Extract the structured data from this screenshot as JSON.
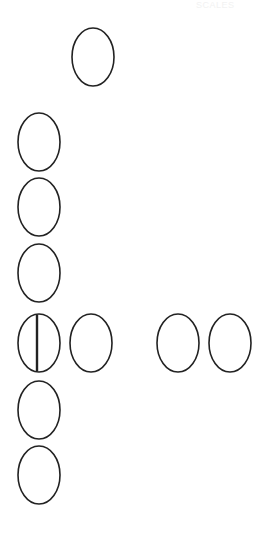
{
  "header": {
    "corner_text": "SCALES"
  },
  "diagram": {
    "colors": {
      "stroke": "#222222",
      "background": "#ffffff"
    },
    "oval_size": {
      "rx": 21,
      "ry": 29
    },
    "ovals": [
      {
        "id": "top",
        "cx": 93,
        "cy": 57,
        "divided": false
      },
      {
        "id": "left-1",
        "cx": 39,
        "cy": 142,
        "divided": false
      },
      {
        "id": "left-2",
        "cx": 39,
        "cy": 207,
        "divided": false
      },
      {
        "id": "left-3",
        "cx": 39,
        "cy": 273,
        "divided": false
      },
      {
        "id": "row-divided",
        "cx": 39,
        "cy": 343,
        "divided": true
      },
      {
        "id": "row-2",
        "cx": 91,
        "cy": 343,
        "divided": false
      },
      {
        "id": "row-3",
        "cx": 178,
        "cy": 343,
        "divided": false
      },
      {
        "id": "row-4",
        "cx": 230,
        "cy": 343,
        "divided": false
      },
      {
        "id": "left-5",
        "cx": 39,
        "cy": 410,
        "divided": false
      },
      {
        "id": "left-6",
        "cx": 39,
        "cy": 475,
        "divided": false
      }
    ]
  }
}
